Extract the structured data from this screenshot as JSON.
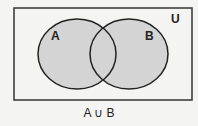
{
  "diagram": {
    "type": "venn",
    "universe_label": "U",
    "sets": [
      {
        "label": "A",
        "shaded": true
      },
      {
        "label": "B",
        "shaded": true
      }
    ],
    "caption": "A ∪ B",
    "colors": {
      "fill": "#d4d4d4",
      "stroke": "#222222",
      "background": "#f4f4f2"
    }
  }
}
